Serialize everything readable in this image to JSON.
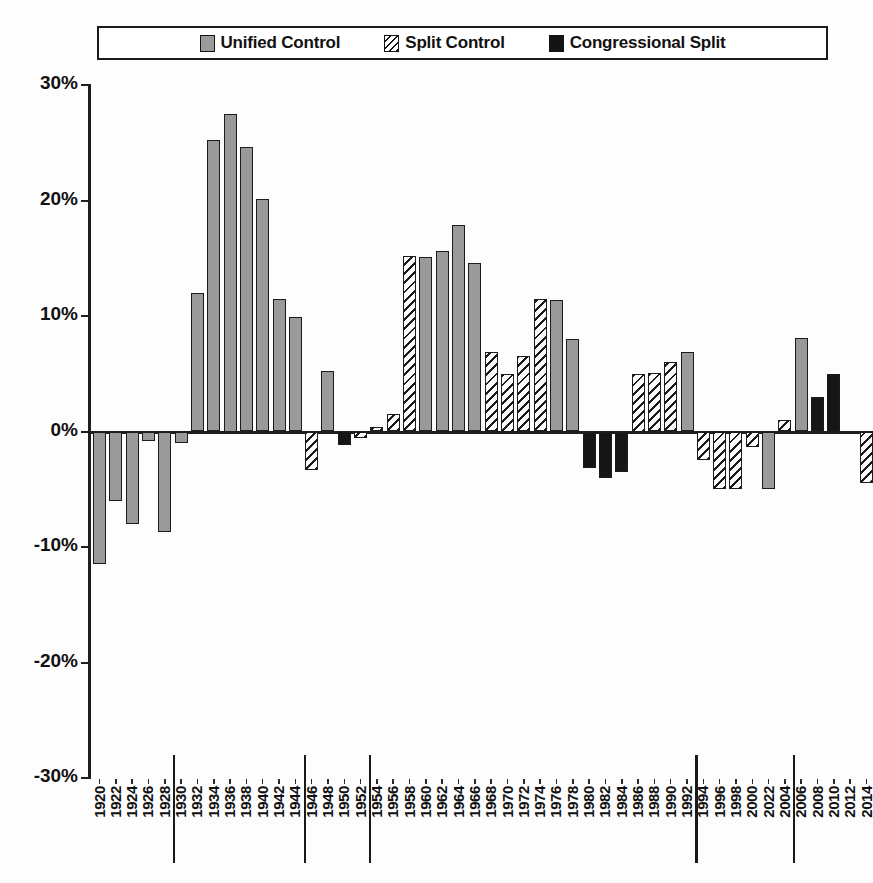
{
  "legend": {
    "items": [
      {
        "label": "Unified Control",
        "pattern": "solid-gray",
        "color": "#9a9a9a"
      },
      {
        "label": "Split Control",
        "pattern": "diagonal-hatch",
        "color": "#ffffff"
      },
      {
        "label": "Congressional Split",
        "pattern": "solid-black",
        "color": "#141414"
      }
    ]
  },
  "axes": {
    "y_ticks": [
      "30%",
      "20%",
      "10%",
      "0%",
      "-10%",
      "-20%",
      "-30%"
    ],
    "y_values": [
      30,
      20,
      10,
      0,
      -10,
      -20,
      -30
    ],
    "x_label": "",
    "y_label": ""
  },
  "caption": "",
  "chart_data": {
    "type": "bar",
    "title": "",
    "subtitle": "",
    "xlabel": "",
    "ylabel": "",
    "ylim": [
      -30,
      30
    ],
    "y_tick_interval": 10,
    "grid": false,
    "legend_position": "top",
    "value_unit": "percent",
    "legend_entries": [
      "Unified Control",
      "Split Control",
      "Congressional Split"
    ],
    "era_separators_after": [
      "1928",
      "1944",
      "1952",
      "1992",
      "2004"
    ],
    "categories": [
      "1920",
      "1922",
      "1924",
      "1926",
      "1928",
      "1930",
      "1932",
      "1934",
      "1936",
      "1938",
      "1940",
      "1942",
      "1944",
      "1946",
      "1948",
      "1950",
      "1952",
      "1954",
      "1956",
      "1958",
      "1960",
      "1962",
      "1964",
      "1966",
      "1968",
      "1970",
      "1972",
      "1974",
      "1976",
      "1978",
      "1980",
      "1982",
      "1984",
      "1986",
      "1988",
      "1990",
      "1992",
      "1994",
      "1996",
      "1998",
      "2000",
      "2022",
      "2004",
      "2006",
      "2008",
      "2010",
      "2012",
      "2014"
    ],
    "values": [
      -11.5,
      -6.0,
      -8.0,
      -0.8,
      -8.7,
      -1.0,
      12.0,
      25.2,
      27.5,
      24.6,
      20.1,
      11.5,
      9.9,
      -3.3,
      5.2,
      -1.2,
      -0.6,
      0.4,
      1.5,
      15.2,
      15.1,
      15.6,
      17.9,
      14.6,
      6.9,
      5.0,
      6.5,
      11.5,
      11.4,
      8.0,
      -3.2,
      -4.0,
      -3.5,
      5.0,
      5.1,
      6.0,
      6.9,
      -2.5,
      -5.0,
      -5.0,
      -1.3,
      -5.0,
      1.0,
      8.1,
      3.0,
      5.0,
      0.0,
      -4.5
    ],
    "categories_series": [
      "unified",
      "unified",
      "unified",
      "unified",
      "unified",
      "unified",
      "unified",
      "unified",
      "unified",
      "unified",
      "unified",
      "unified",
      "unified",
      "split",
      "unified",
      "congressional",
      "split",
      "split",
      "split",
      "split",
      "unified",
      "unified",
      "unified",
      "unified",
      "split",
      "split",
      "split",
      "split",
      "unified",
      "unified",
      "congressional",
      "congressional",
      "congressional",
      "split",
      "split",
      "split",
      "unified",
      "split",
      "split",
      "split",
      "split",
      "unified",
      "split",
      "unified",
      "congressional",
      "congressional",
      "congressional",
      "split"
    ],
    "series": [
      {
        "name": "Unified Control",
        "points": [
          {
            "x": "1920",
            "y": -11.5
          },
          {
            "x": "1922",
            "y": -6.0
          },
          {
            "x": "1924",
            "y": -8.0
          },
          {
            "x": "1926",
            "y": -0.8
          },
          {
            "x": "1928",
            "y": -8.7
          },
          {
            "x": "1930",
            "y": -1.0
          },
          {
            "x": "1932",
            "y": 12.0
          },
          {
            "x": "1934",
            "y": 25.2
          },
          {
            "x": "1936",
            "y": 27.5
          },
          {
            "x": "1938",
            "y": 24.6
          },
          {
            "x": "1940",
            "y": 20.1
          },
          {
            "x": "1942",
            "y": 11.5
          },
          {
            "x": "1944",
            "y": 9.9
          },
          {
            "x": "1948",
            "y": 5.2
          },
          {
            "x": "1960",
            "y": 15.1
          },
          {
            "x": "1962",
            "y": 15.6
          },
          {
            "x": "1964",
            "y": 17.9
          },
          {
            "x": "1966",
            "y": 14.6
          },
          {
            "x": "1976",
            "y": 11.4
          },
          {
            "x": "1978",
            "y": 8.0
          },
          {
            "x": "1992",
            "y": 6.9
          },
          {
            "x": "2022",
            "y": -5.0
          },
          {
            "x": "2006",
            "y": 8.1
          }
        ]
      },
      {
        "name": "Split Control",
        "points": [
          {
            "x": "1946",
            "y": -3.3
          },
          {
            "x": "1952",
            "y": -0.6
          },
          {
            "x": "1954",
            "y": 0.4
          },
          {
            "x": "1956",
            "y": 1.5
          },
          {
            "x": "1958",
            "y": 15.2
          },
          {
            "x": "1968",
            "y": 6.9
          },
          {
            "x": "1970",
            "y": 5.0
          },
          {
            "x": "1972",
            "y": 6.5
          },
          {
            "x": "1974",
            "y": 11.5
          },
          {
            "x": "1986",
            "y": 5.0
          },
          {
            "x": "1988",
            "y": 5.1
          },
          {
            "x": "1990",
            "y": 6.0
          },
          {
            "x": "1994",
            "y": -2.5
          },
          {
            "x": "1996",
            "y": -5.0
          },
          {
            "x": "1998",
            "y": -5.0
          },
          {
            "x": "2000",
            "y": -1.3
          },
          {
            "x": "2004",
            "y": 1.0
          },
          {
            "x": "2014",
            "y": -4.5
          }
        ]
      },
      {
        "name": "Congressional Split",
        "points": [
          {
            "x": "1950",
            "y": -1.2
          },
          {
            "x": "1980",
            "y": -3.2
          },
          {
            "x": "1982",
            "y": -4.0
          },
          {
            "x": "1984",
            "y": -3.5
          },
          {
            "x": "2008",
            "y": 3.0
          },
          {
            "x": "2010",
            "y": 5.0
          },
          {
            "x": "2012",
            "y": 0.0
          }
        ]
      }
    ]
  }
}
